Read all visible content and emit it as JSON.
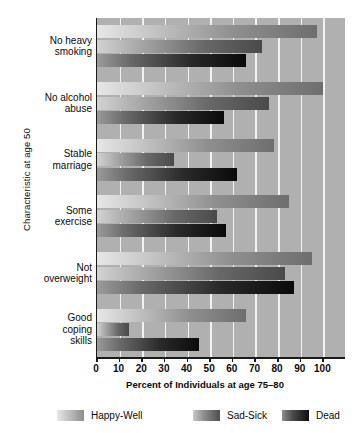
{
  "chart_data": {
    "type": "bar",
    "orientation": "horizontal",
    "title": "",
    "xlabel": "Percent of Individuals at age 75–80",
    "ylabel": "Characteristic at age 50",
    "xlim": [
      0,
      110
    ],
    "xticks": [
      0,
      10,
      20,
      30,
      40,
      50,
      60,
      70,
      80,
      90,
      100
    ],
    "xticklabels": [
      "0",
      "10",
      "20",
      "30",
      "40",
      "50",
      "60",
      "70",
      "80",
      "90",
      "100"
    ],
    "grid": "vertical",
    "legend_position": "bottom",
    "categories": [
      "No heavy smoking",
      "No alcohol abuse",
      "Stable marriage",
      "Some exercise",
      "Not overweight",
      "Good coping skills"
    ],
    "category_lines": [
      [
        "No heavy",
        "smoking"
      ],
      [
        "No alcohol",
        "abuse"
      ],
      [
        "Stable",
        "marriage"
      ],
      [
        "Some",
        "exercise"
      ],
      [
        "Not",
        "overweight"
      ],
      [
        "Good",
        "coping",
        "skills"
      ]
    ],
    "series": [
      {
        "name": "Happy-Well",
        "values": [
          97,
          100,
          78,
          85,
          95,
          66
        ]
      },
      {
        "name": "Sad-Sick",
        "values": [
          73,
          76,
          34,
          53,
          83,
          14
        ]
      },
      {
        "name": "Dead",
        "values": [
          66,
          56,
          62,
          57,
          87,
          45
        ]
      }
    ],
    "colors": {
      "plot_background": "#b0b0b0",
      "gridline": "#f2f2f2",
      "axis": "#1a1a1a",
      "happy_well": "#8f8f8f",
      "sad_sick": "#5a5a5a",
      "dead": "#141414"
    }
  },
  "legend": {
    "items": [
      {
        "label": "Happy-Well"
      },
      {
        "label": "Sad-Sick"
      },
      {
        "label": "Dead"
      }
    ]
  }
}
